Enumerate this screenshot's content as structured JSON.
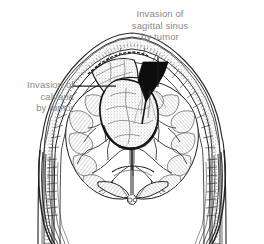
{
  "figure": {
    "type": "medical-line-illustration",
    "background_color": "#ffffff",
    "ink_color": "#1a1a1a",
    "shading_color": "#9a9a9a",
    "label_color": "#8a8a8a"
  },
  "labels": {
    "sagittal_sinus": {
      "line1": "Invasion of",
      "line2": "sagittal sinus",
      "line3": "by tumor",
      "leader": "vertical-line-down"
    },
    "calvaria": {
      "line1": "Invasion of",
      "line2": "calvaria",
      "line3": "by tumor",
      "leader": "horizontal-line-right"
    }
  },
  "anatomy": {
    "structures": [
      "scalp",
      "calvaria",
      "dura mater",
      "superior sagittal sinus",
      "tumor mass",
      "left cerebral hemisphere",
      "right cerebral hemisphere",
      "gyri",
      "sulci",
      "falx cerebri",
      "lateral ventricles",
      "corpus callosum",
      "temporalis muscle"
    ]
  }
}
